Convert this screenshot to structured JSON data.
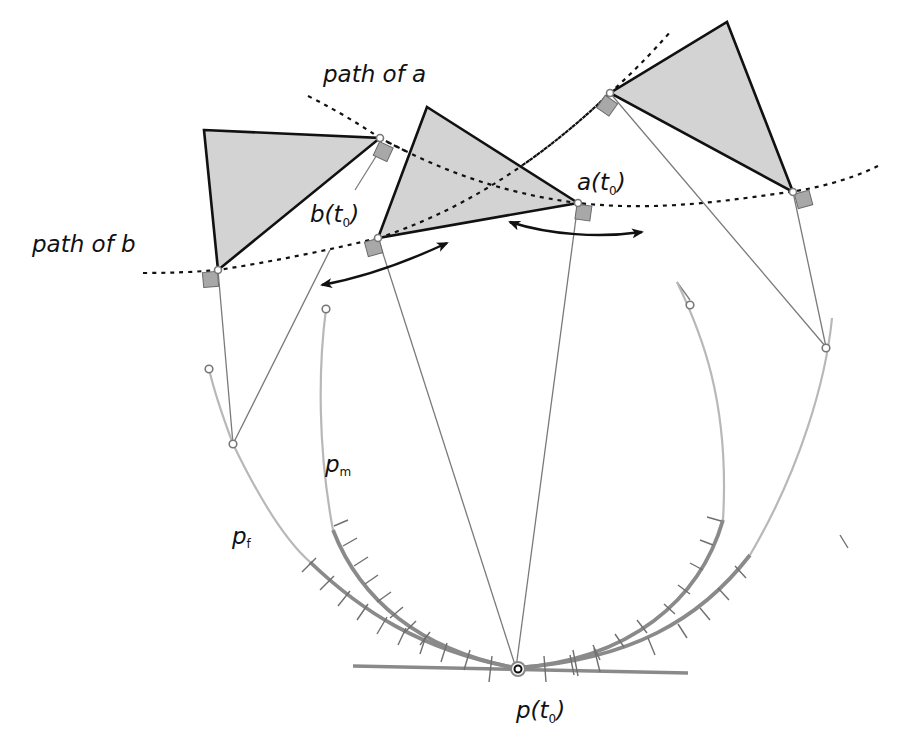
{
  "diagram": {
    "labels": {
      "path_a": "path of a",
      "path_b": "path of b",
      "a_t0": {
        "main": "a(t",
        "sub": "0",
        "close": ")"
      },
      "b_t0": {
        "main": "b(t",
        "sub": "0",
        "close": ")"
      },
      "p_t0": {
        "main": "p(t",
        "sub": "0",
        "close": ")"
      },
      "p_m": {
        "main": "p",
        "sub": "m"
      },
      "p_f": {
        "main": "p",
        "sub": "f"
      }
    },
    "elements": {
      "triangles": 3,
      "dotted_paths": [
        "path of a",
        "path of b"
      ],
      "curves": [
        "p_f",
        "p_m",
        "right inner curve",
        "right outer curve"
      ],
      "double_arrows": 2,
      "tangent_line": "horizontal tangent at p(t0)"
    },
    "colors": {
      "triangle_fill": "#d3d3d3",
      "outline": "#111111",
      "curve_light": "#b8b8b8",
      "curve_dark": "#8a8a8a",
      "square_marker": "#a8a8a8"
    }
  }
}
